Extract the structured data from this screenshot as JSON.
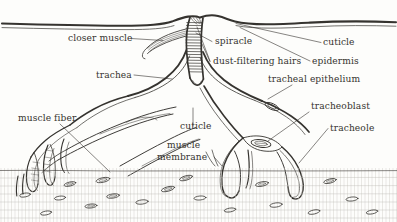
{
  "figure": {
    "name": "insect-spiracle-trachea-diagram",
    "background_color": "#fdfdfb",
    "ink_color": "#35332f",
    "labels": [
      {
        "id": "closer-muscle",
        "text": "closer muscle",
        "x": 68,
        "y": 41,
        "anchor": "start"
      },
      {
        "id": "trachea",
        "text": "trachea",
        "x": 96,
        "y": 78,
        "anchor": "start"
      },
      {
        "id": "muscle-fiber",
        "text": "muscle fiber",
        "x": 18,
        "y": 121,
        "anchor": "start"
      },
      {
        "id": "spiracle",
        "text": "spiracle",
        "x": 215,
        "y": 44,
        "anchor": "start"
      },
      {
        "id": "dust-filtering-hairs",
        "text": "dust-filtering hairs",
        "x": 213,
        "y": 64,
        "anchor": "start"
      },
      {
        "id": "cuticle-top",
        "text": "cuticle",
        "x": 323,
        "y": 45,
        "anchor": "start"
      },
      {
        "id": "epidermis",
        "text": "epidermis",
        "x": 312,
        "y": 64,
        "anchor": "start"
      },
      {
        "id": "tracheal-epithelium",
        "text": "tracheal epithelium",
        "x": 268,
        "y": 82,
        "anchor": "start"
      },
      {
        "id": "tracheoblast",
        "text": "tracheoblast",
        "x": 311,
        "y": 109,
        "anchor": "start"
      },
      {
        "id": "tracheole",
        "text": "tracheole",
        "x": 330,
        "y": 131,
        "anchor": "start"
      },
      {
        "id": "cuticle-mid",
        "text": "cuticle",
        "x": 180,
        "y": 129,
        "anchor": "start"
      },
      {
        "id": "muscle-membrane-1",
        "text": "muscle",
        "x": 167,
        "y": 148,
        "anchor": "start"
      },
      {
        "id": "muscle-membrane-2",
        "text": "membrane",
        "x": 157,
        "y": 160,
        "anchor": "start"
      }
    ],
    "structures": [
      "body-wall-cuticle-surface",
      "spiracle-atrium-with-taenidia",
      "closer-muscle-bundle",
      "main-tracheal-trunk",
      "tracheal-branches",
      "tracheoblast-nucleus",
      "tracheole-terminal-branches",
      "muscle-fiber-bundles",
      "muscle-tissue-nuclei"
    ]
  }
}
